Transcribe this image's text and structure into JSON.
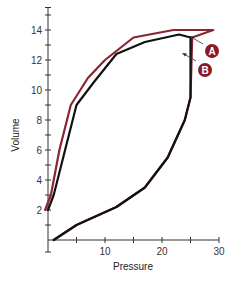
{
  "chart_data": {
    "type": "line",
    "title": "",
    "xlabel": "Pressure",
    "ylabel": "Volume",
    "xlim": [
      0,
      30
    ],
    "ylim": [
      0,
      15
    ],
    "x_ticks": [
      10,
      20,
      30
    ],
    "x_minor_ticks": [
      5,
      15,
      25
    ],
    "y_ticks": [
      2,
      4,
      6,
      8,
      10,
      12,
      14
    ],
    "y_minor_ticks": [
      1,
      3,
      5,
      7,
      9,
      11,
      13,
      15
    ],
    "grid": false,
    "legend": "none",
    "series": [
      {
        "name": "A",
        "color": "#8b2630",
        "points": [
          [
            1,
            0
          ],
          [
            5,
            1
          ],
          [
            12,
            2.2
          ],
          [
            17,
            3.5
          ],
          [
            21,
            5.5
          ],
          [
            24,
            8
          ],
          [
            25,
            9.5
          ],
          [
            25.3,
            13.5
          ],
          [
            29,
            14
          ],
          [
            22,
            14
          ],
          [
            15,
            13.5
          ],
          [
            10,
            12
          ],
          [
            7,
            10.8
          ],
          [
            4,
            9
          ],
          [
            2,
            6
          ],
          [
            0.5,
            3
          ],
          [
            -0.5,
            2
          ]
        ]
      },
      {
        "name": "B",
        "color": "#111111",
        "points": [
          [
            1,
            0
          ],
          [
            5,
            1
          ],
          [
            12,
            2.2
          ],
          [
            17,
            3.5
          ],
          [
            21,
            5.5
          ],
          [
            24,
            8
          ],
          [
            25,
            9.5
          ],
          [
            25,
            13.5
          ],
          [
            23,
            13.7
          ],
          [
            17,
            13.2
          ],
          [
            12,
            12.4
          ],
          [
            8,
            10.5
          ],
          [
            5,
            9
          ],
          [
            3,
            6
          ],
          [
            1,
            3
          ],
          [
            0,
            2
          ]
        ]
      }
    ],
    "annotations": [
      {
        "label": "A",
        "target": [
          25.5,
          13.6
        ],
        "badge_color": "#8b1a24"
      },
      {
        "label": "B",
        "target": [
          25.3,
          12.8
        ],
        "badge_color": "#8b1a24"
      }
    ]
  },
  "axes": {
    "x_title": "Pressure",
    "y_title": "Volume",
    "x_tick_labels": [
      "10",
      "20",
      "30"
    ],
    "y_tick_labels": [
      "2",
      "4",
      "6",
      "8",
      "10",
      "12",
      "14"
    ]
  },
  "markers": {
    "a": "A",
    "b": "B"
  }
}
